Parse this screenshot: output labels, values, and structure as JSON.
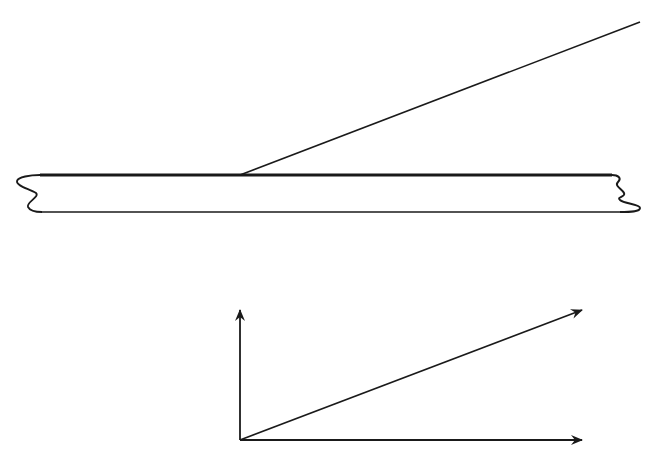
{
  "diagram": {
    "colors": {
      "stroke": "#1a1a1a",
      "background": "#ffffff"
    },
    "top_figure": {
      "plate": {
        "top_y": 175,
        "bottom_y": 212,
        "left_x": 18,
        "right_x": 625,
        "broken_ends": true
      },
      "ray": {
        "from": [
          240,
          175
        ],
        "to": [
          640,
          22
        ]
      }
    },
    "bottom_figure": {
      "origin": [
        240,
        440
      ],
      "vectors": [
        {
          "name": "vertical",
          "to": [
            240,
            310
          ]
        },
        {
          "name": "horizontal",
          "to": [
            582,
            440
          ]
        },
        {
          "name": "diagonal",
          "to": [
            582,
            310
          ]
        }
      ]
    }
  }
}
